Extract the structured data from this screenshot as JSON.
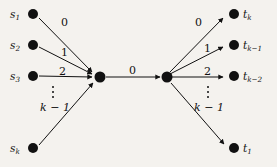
{
  "figure": {
    "background_color": "#f4f2ee",
    "ink_color": "#111111",
    "type": "directed-graph"
  },
  "nodes": {
    "sources": [
      {
        "id": "s1",
        "label_main": "s",
        "label_sub": "1",
        "x": 33,
        "y": 14
      },
      {
        "id": "s2",
        "label_main": "s",
        "label_sub": "2",
        "x": 33,
        "y": 45
      },
      {
        "id": "s3",
        "label_main": "s",
        "label_sub": "3",
        "x": 33,
        "y": 76
      },
      {
        "id": "sk",
        "label_main": "s",
        "label_sub": "k",
        "x": 33,
        "y": 148
      }
    ],
    "hubs": [
      {
        "id": "hub-left",
        "x": 100,
        "y": 77
      },
      {
        "id": "hub-right",
        "x": 167,
        "y": 77
      }
    ],
    "targets": [
      {
        "id": "tk",
        "label_main": "t",
        "label_sub": "k",
        "x": 234,
        "y": 14
      },
      {
        "id": "tk1",
        "label_main": "t",
        "label_sub": "k−1",
        "x": 234,
        "y": 45
      },
      {
        "id": "tk2",
        "label_main": "t",
        "label_sub": "k−2",
        "x": 234,
        "y": 76
      },
      {
        "id": "t1",
        "label_main": "t",
        "label_sub": "1",
        "x": 234,
        "y": 148
      }
    ]
  },
  "edge_labels": {
    "left_fan": [
      {
        "text": "0",
        "x": 64,
        "y": 22
      },
      {
        "text": "1",
        "x": 64,
        "y": 52
      },
      {
        "text": "2",
        "x": 62,
        "y": 71
      },
      {
        "text": "k − 1",
        "x": 43,
        "y": 107
      }
    ],
    "center": {
      "text": "0",
      "x": 131,
      "y": 70
    },
    "right_fan": [
      {
        "text": "0",
        "x": 197,
        "y": 22
      },
      {
        "text": "1",
        "x": 206,
        "y": 48
      },
      {
        "text": "2",
        "x": 206,
        "y": 71
      },
      {
        "text": "k − 1",
        "x": 196,
        "y": 107
      }
    ]
  },
  "ellipses": [
    {
      "id": "left-vdots",
      "x": 52,
      "y": 88
    },
    {
      "id": "right-vdots",
      "x": 207,
      "y": 88
    }
  ]
}
